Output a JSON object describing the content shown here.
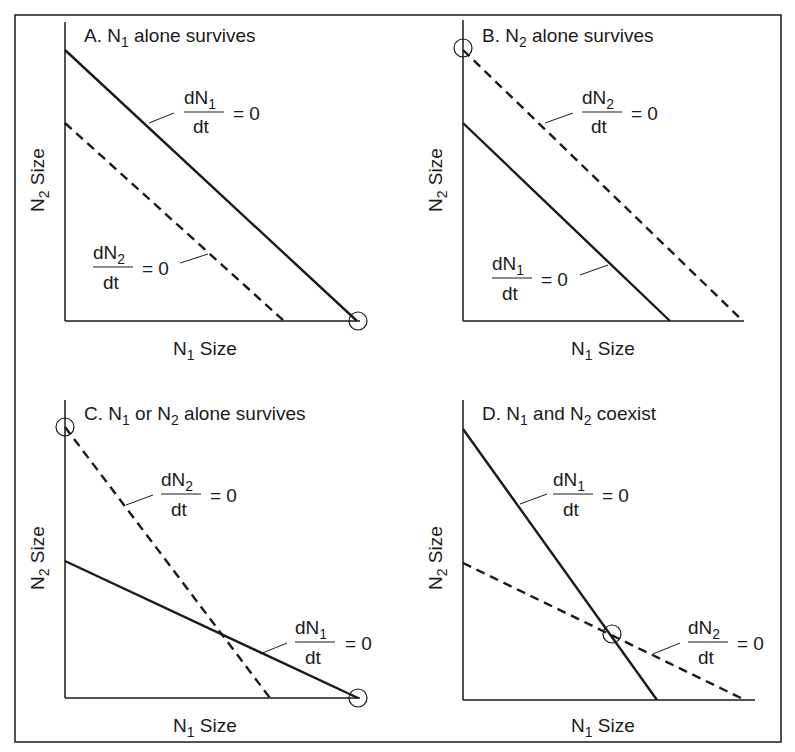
{
  "figure": {
    "panels": [
      {
        "id": "A",
        "title": "A. N",
        "title_sub1": "1",
        "title_rest": " alone survives",
        "xlabel": "N",
        "xlabel_sub": "1",
        "xlabel_rest": " Size",
        "ylabel": "N",
        "ylabel_sub": "2",
        "ylabel_rest": " Size",
        "label_top": {
          "num": "dN",
          "sub": "1",
          "den": "dt",
          "eq": "= 0"
        },
        "label_bottom": {
          "num": "dN",
          "sub": "2",
          "den": "dt",
          "eq": "= 0"
        }
      },
      {
        "id": "B",
        "title": "B. N",
        "title_sub1": "2",
        "title_rest": " alone survives",
        "xlabel": "N",
        "xlabel_sub": "1",
        "xlabel_rest": " Size",
        "ylabel": "N",
        "ylabel_sub": "2",
        "ylabel_rest": " Size",
        "label_top": {
          "num": "dN",
          "sub": "2",
          "den": "dt",
          "eq": "= 0"
        },
        "label_bottom": {
          "num": "dN",
          "sub": "1",
          "den": "dt",
          "eq": "= 0"
        }
      },
      {
        "id": "C",
        "title": "C. N",
        "title_sub1": "1",
        "title_mid": " or N",
        "title_sub2": "2",
        "title_rest": " alone survives",
        "xlabel": "N",
        "xlabel_sub": "1",
        "xlabel_rest": " Size",
        "ylabel": "N",
        "ylabel_sub": "2",
        "ylabel_rest": " Size",
        "label_top": {
          "num": "dN",
          "sub": "2",
          "den": "dt",
          "eq": "= 0"
        },
        "label_bottom": {
          "num": "dN",
          "sub": "1",
          "den": "dt",
          "eq": "= 0"
        }
      },
      {
        "id": "D",
        "title": "D. N",
        "title_sub1": "1",
        "title_mid": " and N",
        "title_sub2": "2",
        "title_rest": " coexist",
        "xlabel": "N",
        "xlabel_sub": "1",
        "xlabel_rest": " Size",
        "ylabel": "N",
        "ylabel_sub": "2",
        "ylabel_rest": " Size",
        "label_top": {
          "num": "dN",
          "sub": "1",
          "den": "dt",
          "eq": "= 0"
        },
        "label_bottom": {
          "num": "dN",
          "sub": "2",
          "den": "dt",
          "eq": "= 0"
        }
      }
    ],
    "legend": {
      "solid_line": "dN1/dt = 0 (N1 isocline)",
      "dashed_line": "dN2/dt = 0 (N2 isocline)",
      "circle": "stable equilibrium"
    },
    "colors": {
      "ink": "#1a1a1a",
      "background": "#ffffff"
    }
  }
}
